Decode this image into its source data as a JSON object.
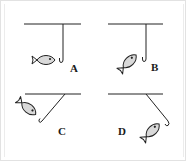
{
  "figure": {
    "line_color": "#222222",
    "fish_fill": "#d9d9d9",
    "border_color": "#e2e2e2",
    "panels": [
      {
        "id": "A",
        "label": "A",
        "hook": "vertical",
        "fish_orientation": "horizontal, head right"
      },
      {
        "id": "B",
        "label": "B",
        "hook": "vertical",
        "fish_orientation": "tilted, head up-right"
      },
      {
        "id": "C",
        "label": "C",
        "hook": "diagonal down-left",
        "fish_orientation": "tilted, head down-right"
      },
      {
        "id": "D",
        "label": "D",
        "hook": "diagonal down-right",
        "fish_orientation": "tilted, head up-right"
      }
    ]
  }
}
